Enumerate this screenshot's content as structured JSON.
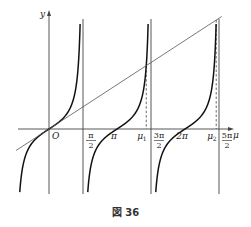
{
  "caption": "図 36",
  "axes": {
    "x_label": "μ",
    "y_label": "y",
    "origin_label": "O"
  },
  "x_ticks": [
    {
      "id": "pi_half",
      "num": "π",
      "den": "2",
      "value": 1.5708
    },
    {
      "id": "pi",
      "text": "π",
      "value": 3.1416
    },
    {
      "id": "mu1",
      "text": "μ",
      "sub": "1",
      "value": 4.4934
    },
    {
      "id": "three_pi_half",
      "num": "3π",
      "den": "2",
      "value": 4.7124
    },
    {
      "id": "two_pi",
      "text": "2π",
      "value": 6.2832
    },
    {
      "id": "mu2",
      "text": "μ",
      "sub": "2",
      "value": 7.7253
    },
    {
      "id": "five_pi_half",
      "num": "5π",
      "den": "2",
      "value": 7.854
    }
  ],
  "chart_data": {
    "type": "line",
    "title": "図 36",
    "xlabel": "μ",
    "ylabel": "y",
    "series": [
      {
        "name": "y = tan μ",
        "kind": "function",
        "branches": [
          [
            -1.5708,
            1.5708
          ],
          [
            1.5708,
            4.7124
          ],
          [
            4.7124,
            7.854
          ]
        ]
      },
      {
        "name": "y = μ",
        "kind": "line",
        "x_range": [
          -1.5,
          8.0
        ]
      }
    ],
    "asymptotes": [
      1.5708,
      4.7124,
      7.854
    ],
    "intersections": [
      {
        "label": "O",
        "x": 0,
        "y": 0
      },
      {
        "label": "μ1",
        "x": 4.4934,
        "y": 4.4934
      },
      {
        "label": "μ2",
        "x": 7.7253,
        "y": 7.7253
      }
    ],
    "xlim": [
      -2.2,
      8.5
    ],
    "ylim": [
      -4.6,
      8.0
    ],
    "grid": false,
    "legend": "none"
  }
}
